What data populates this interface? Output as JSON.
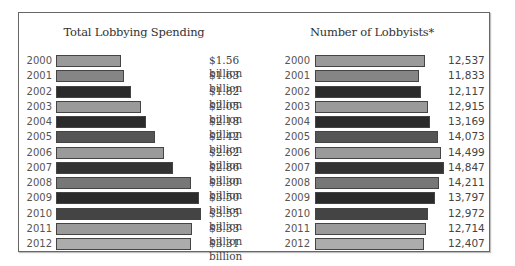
{
  "chart_data": [
    {
      "type": "bar",
      "orientation": "horizontal",
      "title": "Total Lobbying Spending",
      "categories": [
        "2000",
        "2001",
        "2002",
        "2003",
        "2004",
        "2005",
        "2006",
        "2007",
        "2008",
        "2009",
        "2010",
        "2011",
        "2012"
      ],
      "values": [
        1.56,
        1.63,
        1.82,
        2.05,
        2.18,
        2.42,
        2.62,
        2.86,
        3.3,
        3.5,
        3.55,
        3.33,
        3.31
      ],
      "value_labels": [
        "$1.56 billion",
        "$1.63 billion",
        "$1.82 billion",
        "$2.05 billion",
        "$2.18 billion",
        "$2.42 billion",
        "$2.62 billion",
        "$2.86 billion",
        "$3.30 billion",
        "$3.50 billion",
        "$3.55 billion",
        "$3.33 billion",
        "$3.31 billion"
      ],
      "unit": "billion USD",
      "xlabel": "",
      "ylabel": "",
      "grid": false,
      "bar_colors": [
        "#9a9a9a",
        "#858585",
        "#2b2b2b",
        "#9a9a9a",
        "#2b2b2b",
        "#555555",
        "#9a9a9a",
        "#333333",
        "#777777",
        "#2b2b2b",
        "#444444",
        "#9a9a9a",
        "#acacac"
      ]
    },
    {
      "type": "bar",
      "orientation": "horizontal",
      "title": "Number of Lobbyists*",
      "categories": [
        "2000",
        "2001",
        "2002",
        "2003",
        "2004",
        "2005",
        "2006",
        "2007",
        "2008",
        "2009",
        "2010",
        "2011",
        "2012"
      ],
      "values": [
        12537,
        11833,
        12117,
        12915,
        13169,
        14073,
        14499,
        14847,
        14211,
        13797,
        12972,
        12714,
        12407
      ],
      "value_labels": [
        "12,537",
        "11,833",
        "12,117",
        "12,915",
        "13,169",
        "14,073",
        "14,499",
        "14,847",
        "14,211",
        "13,797",
        "12,972",
        "12,714",
        "12,407"
      ],
      "xlabel": "",
      "ylabel": "",
      "grid": false,
      "bar_colors": [
        "#9a9a9a",
        "#858585",
        "#2b2b2b",
        "#9a9a9a",
        "#2b2b2b",
        "#555555",
        "#9a9a9a",
        "#333333",
        "#777777",
        "#2b2b2b",
        "#444444",
        "#9a9a9a",
        "#acacac"
      ]
    }
  ],
  "left": {
    "title": "Total Lobbying Spending",
    "rows": [
      {
        "year": "2000",
        "label": "$1.56 billion"
      },
      {
        "year": "2001",
        "label": "$1.63 billion"
      },
      {
        "year": "2002",
        "label": "$1.82 billion"
      },
      {
        "year": "2003",
        "label": "$2.05 billion"
      },
      {
        "year": "2004",
        "label": "$2.18 billion"
      },
      {
        "year": "2005",
        "label": "$2.42 billion"
      },
      {
        "year": "2006",
        "label": "$2.62 billion"
      },
      {
        "year": "2007",
        "label": "$2.86 billion"
      },
      {
        "year": "2008",
        "label": "$3.30 billion"
      },
      {
        "year": "2009",
        "label": "$3.50 billion"
      },
      {
        "year": "2010",
        "label": "$3.55 billion"
      },
      {
        "year": "2011",
        "label": "$3.33 billion"
      },
      {
        "year": "2012",
        "label": "$3.31 billion"
      }
    ]
  },
  "right": {
    "title": "Number of Lobbyists*",
    "rows": [
      {
        "year": "2000",
        "label": "12,537"
      },
      {
        "year": "2001",
        "label": "11,833"
      },
      {
        "year": "2002",
        "label": "12,117"
      },
      {
        "year": "2003",
        "label": "12,915"
      },
      {
        "year": "2004",
        "label": "13,169"
      },
      {
        "year": "2005",
        "label": "14,073"
      },
      {
        "year": "2006",
        "label": "14,499"
      },
      {
        "year": "2007",
        "label": "14,847"
      },
      {
        "year": "2008",
        "label": "14,211"
      },
      {
        "year": "2009",
        "label": "13,797"
      },
      {
        "year": "2010",
        "label": "12,972"
      },
      {
        "year": "2011",
        "label": "12,714"
      },
      {
        "year": "2012",
        "label": "12,407"
      }
    ]
  }
}
